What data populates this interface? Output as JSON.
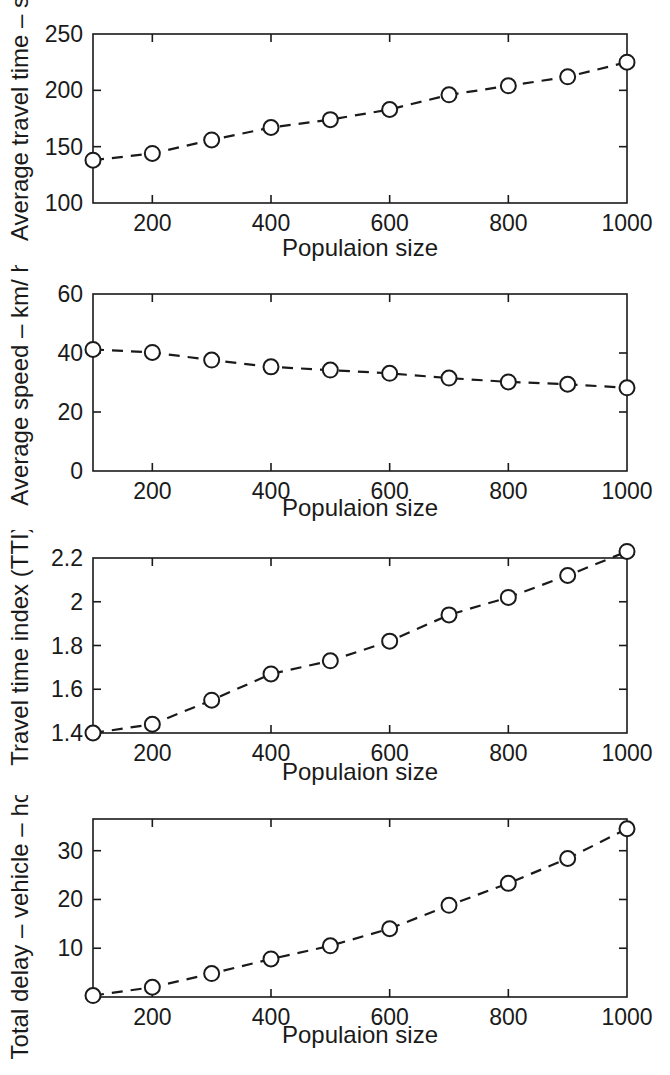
{
  "figure": {
    "name": "traffic-performance-vs-population-size",
    "panel_count": 4,
    "background_color": "#ffffff",
    "ink_color": "#1a1a1a"
  },
  "chart_data": [
    {
      "type": "line",
      "id": "average-travel-time",
      "title": "",
      "xlabel": "Populaion size",
      "ylabel": "Average travel time – s",
      "x": [
        100,
        200,
        300,
        400,
        500,
        600,
        700,
        800,
        900,
        1000
      ],
      "values": [
        138,
        144,
        156,
        167,
        174,
        183,
        196,
        204,
        212,
        225
      ],
      "series": [
        {
          "name": "Average travel time",
          "values": [
            138,
            144,
            156,
            167,
            174,
            183,
            196,
            204,
            212,
            225
          ]
        }
      ],
      "xlim": [
        100,
        1000
      ],
      "ylim": [
        100,
        250
      ],
      "xticks": [
        200,
        400,
        600,
        800,
        1000
      ],
      "xtick_labels": [
        "200",
        "400",
        "600",
        "800",
        "1000"
      ],
      "yticks": [
        100,
        150,
        200,
        250
      ],
      "ytick_labels": [
        "100",
        "150",
        "200",
        "250"
      ],
      "grid": false,
      "legend": "none",
      "marker": "circle",
      "linestyle": "dashed"
    },
    {
      "type": "line",
      "id": "average-speed",
      "title": "",
      "xlabel": "Populaion size",
      "ylabel": "Average speed – km/ h",
      "x": [
        100,
        200,
        300,
        400,
        500,
        600,
        700,
        800,
        900,
        1000
      ],
      "values": [
        41.2,
        40.2,
        37.6,
        35.3,
        34.2,
        33.1,
        31.5,
        30.2,
        29.4,
        28.2
      ],
      "series": [
        {
          "name": "Average speed",
          "values": [
            41.2,
            40.2,
            37.6,
            35.3,
            34.2,
            33.1,
            31.5,
            30.2,
            29.4,
            28.2
          ]
        }
      ],
      "xlim": [
        100,
        1000
      ],
      "ylim": [
        0,
        60
      ],
      "xticks": [
        200,
        400,
        600,
        800,
        1000
      ],
      "xtick_labels": [
        "200",
        "400",
        "600",
        "800",
        "1000"
      ],
      "yticks": [
        0,
        20,
        40,
        60
      ],
      "ytick_labels": [
        "0",
        "20",
        "40",
        "60"
      ],
      "grid": false,
      "legend": "none",
      "marker": "circle",
      "linestyle": "dashed"
    },
    {
      "type": "line",
      "id": "travel-time-index",
      "title": "",
      "xlabel": "Populaion size",
      "ylabel": "Travel time index (TTI)",
      "x": [
        100,
        200,
        300,
        400,
        500,
        600,
        700,
        800,
        900,
        1000
      ],
      "values": [
        1.4,
        1.44,
        1.55,
        1.67,
        1.73,
        1.82,
        1.94,
        2.02,
        2.12,
        2.23
      ],
      "series": [
        {
          "name": "Travel time index",
          "values": [
            1.4,
            1.44,
            1.55,
            1.67,
            1.73,
            1.82,
            1.94,
            2.02,
            2.12,
            2.23
          ]
        }
      ],
      "xlim": [
        100,
        1000
      ],
      "ylim": [
        1.4,
        2.2
      ],
      "xticks": [
        200,
        400,
        600,
        800,
        1000
      ],
      "xtick_labels": [
        "200",
        "400",
        "600",
        "800",
        "1000"
      ],
      "yticks": [
        1.4,
        1.6,
        1.8,
        2.0,
        2.2
      ],
      "ytick_labels": [
        "1.4",
        "1.6",
        "1.8",
        "2",
        "2.2"
      ],
      "grid": false,
      "legend": "none",
      "marker": "circle",
      "linestyle": "dashed"
    },
    {
      "type": "line",
      "id": "total-delay",
      "title": "",
      "xlabel": "Populaion size",
      "ylabel": "Total delay – vehicle – hours",
      "x": [
        100,
        200,
        300,
        400,
        500,
        600,
        700,
        800,
        900,
        1000
      ],
      "values": [
        0.3,
        2.0,
        4.8,
        7.8,
        10.5,
        14.0,
        18.8,
        23.3,
        28.4,
        34.5
      ],
      "series": [
        {
          "name": "Total delay",
          "values": [
            0.3,
            2.0,
            4.8,
            7.8,
            10.5,
            14.0,
            18.8,
            23.3,
            28.4,
            34.5
          ]
        }
      ],
      "xlim": [
        100,
        1000
      ],
      "ylim": [
        0,
        36.5
      ],
      "xticks": [
        200,
        400,
        600,
        800,
        1000
      ],
      "xtick_labels": [
        "200",
        "400",
        "600",
        "800",
        "1000"
      ],
      "yticks": [
        10,
        20,
        30
      ],
      "ytick_labels": [
        "10",
        "20",
        "30"
      ],
      "grid": false,
      "legend": "none",
      "marker": "circle",
      "linestyle": "dashed"
    }
  ]
}
